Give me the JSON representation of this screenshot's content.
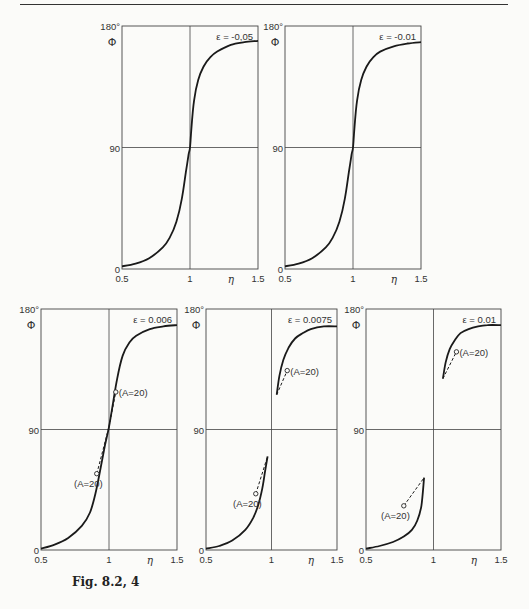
{
  "figure": {
    "caption": "Fig. 8.2, 4"
  },
  "chart_data": [
    {
      "type": "line",
      "id": "top-left",
      "title": "ε = -0,05",
      "xlabel": "η",
      "ylabel": "Φ",
      "xlim": [
        0.5,
        1.5
      ],
      "ylim": [
        0,
        180
      ],
      "xticks": [
        "0.5",
        "1",
        "1.5"
      ],
      "yticks": [
        "0",
        "90",
        "180°"
      ],
      "grid": {
        "vline": 1,
        "hline": 90
      },
      "frame": [
        122,
        26,
        258,
        269
      ],
      "series": [
        {
          "name": "Φ(η)",
          "style": "solid",
          "x": [
            0.5,
            0.6,
            0.7,
            0.8,
            0.85,
            0.9,
            0.94,
            0.97,
            0.99,
            1.0,
            1.01,
            1.03,
            1.06,
            1.1,
            1.15,
            1.2,
            1.3,
            1.4,
            1.5
          ],
          "y": [
            2,
            4,
            8,
            16,
            23,
            35,
            52,
            72,
            85,
            90,
            104,
            125,
            140,
            150,
            157,
            161,
            166,
            168,
            169
          ]
        }
      ],
      "annotations": []
    },
    {
      "type": "line",
      "id": "top-right",
      "title": "ε = -0.01",
      "xlabel": "η",
      "ylabel": "Φ",
      "xlim": [
        0.5,
        1.5
      ],
      "ylim": [
        0,
        180
      ],
      "xticks": [
        "0.5",
        "1",
        "1.5"
      ],
      "yticks": [
        "0",
        "90",
        "180°"
      ],
      "grid": {
        "vline": 1,
        "hline": 90
      },
      "frame": [
        285,
        26,
        421,
        269
      ],
      "series": [
        {
          "name": "Φ(η)",
          "style": "solid",
          "x": [
            0.5,
            0.6,
            0.7,
            0.8,
            0.85,
            0.9,
            0.94,
            0.97,
            0.99,
            1.0,
            1.01,
            1.03,
            1.06,
            1.1,
            1.15,
            1.2,
            1.3,
            1.4,
            1.5
          ],
          "y": [
            2,
            4,
            8,
            16,
            23,
            35,
            52,
            72,
            85,
            90,
            104,
            125,
            140,
            150,
            157,
            161,
            165,
            167,
            168
          ]
        }
      ],
      "annotations": []
    },
    {
      "type": "line",
      "id": "bottom-left",
      "title": "ε = 0.006",
      "xlabel": "η",
      "ylabel": "Φ",
      "xlim": [
        0.5,
        1.5
      ],
      "ylim": [
        0,
        180
      ],
      "xticks": [
        "0.5",
        "1",
        "1.5"
      ],
      "yticks": [
        "0",
        "90",
        "180°"
      ],
      "grid": {
        "vline": 1,
        "hline": 90
      },
      "frame": [
        41,
        309,
        177,
        550
      ],
      "series": [
        {
          "name": "Φ(η)",
          "style": "solid",
          "x": [
            0.5,
            0.6,
            0.7,
            0.8,
            0.86,
            0.9,
            0.94,
            0.97,
            1.0,
            1.03,
            1.06,
            1.1,
            1.15,
            1.2,
            1.3,
            1.4,
            1.5
          ],
          "y": [
            1,
            4,
            9,
            18,
            28,
            42,
            62,
            78,
            92,
            110,
            128,
            145,
            155,
            160,
            165,
            167,
            168
          ]
        },
        {
          "name": "A=20 (upper)",
          "style": "dashed",
          "x": [
            1.0,
            1.05
          ],
          "y": [
            92,
            118
          ]
        },
        {
          "name": "A=20 (lower)",
          "style": "dashed",
          "x": [
            0.91,
            1.0
          ],
          "y": [
            57,
            92
          ]
        }
      ],
      "annotations": [
        {
          "text": "(A=20)",
          "x": 1.05,
          "y": 118,
          "marker": "circle",
          "label_offset": "right"
        },
        {
          "text": "(A=20)",
          "x": 0.91,
          "y": 57,
          "marker": "circle",
          "label_offset": "below-left"
        }
      ]
    },
    {
      "type": "line",
      "id": "bottom-middle",
      "title": "ε = 0.0075",
      "xlabel": "η",
      "ylabel": "Φ",
      "xlim": [
        0.5,
        1.5
      ],
      "ylim": [
        0,
        180
      ],
      "xticks": [
        "0.5",
        "1",
        "1.5"
      ],
      "yticks": [
        "0",
        "90",
        "180°"
      ],
      "grid": {
        "vline": 1,
        "hline": 90
      },
      "frame": [
        206,
        309,
        337,
        550
      ],
      "series": [
        {
          "name": "Φ(η) lower branch",
          "style": "solid",
          "x": [
            0.5,
            0.6,
            0.7,
            0.8,
            0.86,
            0.9,
            0.93,
            0.95,
            0.97
          ],
          "y": [
            1,
            3,
            7,
            15,
            24,
            34,
            46,
            58,
            70
          ]
        },
        {
          "name": "Φ(η) upper branch",
          "style": "solid",
          "x": [
            1.04,
            1.06,
            1.09,
            1.13,
            1.18,
            1.24,
            1.3,
            1.4,
            1.5
          ],
          "y": [
            116,
            130,
            142,
            151,
            158,
            162,
            165,
            167,
            167
          ]
        },
        {
          "name": "A=20 (upper)",
          "style": "dashed",
          "x": [
            1.04,
            1.12
          ],
          "y": [
            116,
            134
          ]
        },
        {
          "name": "A=20 (lower)",
          "style": "dashed",
          "x": [
            0.88,
            0.97
          ],
          "y": [
            42,
            70
          ]
        }
      ],
      "annotations": [
        {
          "text": "(A=20)",
          "x": 1.12,
          "y": 134,
          "marker": "circle",
          "label_offset": "right"
        },
        {
          "text": "(A=20)",
          "x": 0.88,
          "y": 42,
          "marker": "circle",
          "label_offset": "below-left"
        }
      ]
    },
    {
      "type": "line",
      "id": "bottom-right",
      "title": "ε = 0.01",
      "xlabel": "η",
      "ylabel": "Φ",
      "xlim": [
        0.5,
        1.5
      ],
      "ylim": [
        0,
        180
      ],
      "xticks": [
        "0.5",
        "1",
        "1.5"
      ],
      "yticks": [
        "0",
        "90",
        "180°"
      ],
      "grid": {
        "vline": 1,
        "hline": 90
      },
      "frame": [
        366,
        309,
        501,
        550
      ],
      "series": [
        {
          "name": "Φ(η) lower branch",
          "style": "solid",
          "x": [
            0.5,
            0.6,
            0.7,
            0.78,
            0.84,
            0.88,
            0.91,
            0.93
          ],
          "y": [
            1,
            3,
            6,
            10,
            15,
            22,
            33,
            54
          ]
        },
        {
          "name": "Φ(η) upper branch",
          "style": "solid",
          "x": [
            1.07,
            1.09,
            1.12,
            1.16,
            1.2,
            1.26,
            1.33,
            1.4,
            1.5
          ],
          "y": [
            128,
            140,
            150,
            157,
            162,
            165,
            167,
            168,
            168
          ]
        },
        {
          "name": "A=20 (upper)",
          "style": "dashed",
          "x": [
            1.07,
            1.17
          ],
          "y": [
            128,
            148
          ]
        },
        {
          "name": "A=20 (lower)",
          "style": "dashed",
          "x": [
            0.78,
            0.93
          ],
          "y": [
            33,
            54
          ]
        }
      ],
      "annotations": [
        {
          "text": "(A=20)",
          "x": 1.17,
          "y": 148,
          "marker": "circle",
          "label_offset": "right"
        },
        {
          "text": "(A=20)",
          "x": 0.78,
          "y": 33,
          "marker": "circle",
          "label_offset": "below-left"
        }
      ]
    }
  ]
}
